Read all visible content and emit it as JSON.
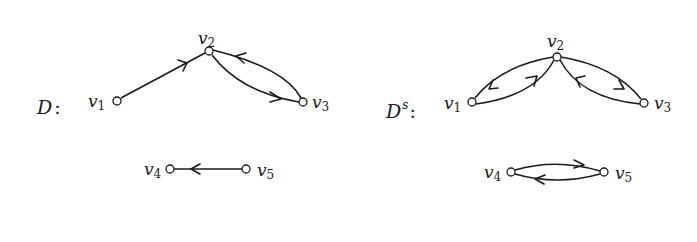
{
  "graphs": [
    {
      "id": "D",
      "label": {
        "main": "D",
        "sup": "",
        "colon": ":"
      },
      "vertices": [
        {
          "name": "v",
          "sub": "1",
          "id": "v1"
        },
        {
          "name": "v",
          "sub": "2",
          "id": "v2"
        },
        {
          "name": "v",
          "sub": "3",
          "id": "v3"
        },
        {
          "name": "v",
          "sub": "4",
          "id": "v4"
        },
        {
          "name": "v",
          "sub": "5",
          "id": "v5"
        }
      ],
      "arcs": [
        {
          "from": "v1",
          "to": "v2"
        },
        {
          "from": "v2",
          "to": "v3"
        },
        {
          "from": "v3",
          "to": "v2"
        },
        {
          "from": "v5",
          "to": "v4"
        }
      ]
    },
    {
      "id": "Ds",
      "label": {
        "main": "D",
        "sup": "s",
        "colon": ":"
      },
      "vertices": [
        {
          "name": "v",
          "sub": "1",
          "id": "v1"
        },
        {
          "name": "v",
          "sub": "2",
          "id": "v2"
        },
        {
          "name": "v",
          "sub": "3",
          "id": "v3"
        },
        {
          "name": "v",
          "sub": "4",
          "id": "v4"
        },
        {
          "name": "v",
          "sub": "5",
          "id": "v5"
        }
      ],
      "arcs": [
        {
          "from": "v1",
          "to": "v2"
        },
        {
          "from": "v2",
          "to": "v1"
        },
        {
          "from": "v2",
          "to": "v3"
        },
        {
          "from": "v3",
          "to": "v2"
        },
        {
          "from": "v4",
          "to": "v5"
        },
        {
          "from": "v5",
          "to": "v4"
        }
      ]
    }
  ]
}
